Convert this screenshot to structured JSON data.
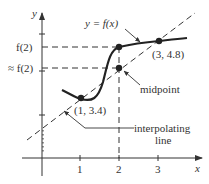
{
  "diagram": {
    "axes": {
      "x_label": "x",
      "y_label": "y",
      "x_ticks": [
        "1",
        "2",
        "3"
      ]
    },
    "y_labels": {
      "f2": "f(2)",
      "approx_f2": "≈ f(2)"
    },
    "curve_label": "y = f(x)",
    "points": [
      {
        "id": "p1",
        "label": "(1, 3.4)",
        "x": 1,
        "y": 3.4
      },
      {
        "id": "p3",
        "label": "(3, 4.8)",
        "x": 3,
        "y": 4.8
      }
    ],
    "midpoint_label": "midpoint",
    "interpolating_line_label": [
      "interpolating",
      "line"
    ]
  }
}
